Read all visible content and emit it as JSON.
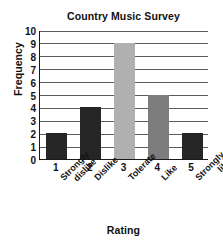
{
  "chart_data": {
    "type": "bar",
    "title": "Country Music Survey",
    "xlabel": "Rating",
    "ylabel": "Frequency",
    "categories": [
      "1",
      "2",
      "3",
      "4",
      "5"
    ],
    "category_labels": [
      [
        "Strongly",
        "dislike"
      ],
      [
        "Dislike"
      ],
      [
        "Tolerate"
      ],
      [
        "Like"
      ],
      [
        "Strongly",
        "like"
      ]
    ],
    "values": [
      2,
      4,
      9,
      5,
      2
    ],
    "bar_colors": [
      "#262626",
      "#262626",
      "#b0b0b0",
      "#7d7d7d",
      "#262626"
    ],
    "ylim": [
      0,
      10
    ],
    "ytick_labels": [
      "0",
      "1",
      "2",
      "3",
      "4",
      "5",
      "6",
      "7",
      "8",
      "9",
      "10"
    ],
    "grid": true,
    "legend": "none"
  }
}
